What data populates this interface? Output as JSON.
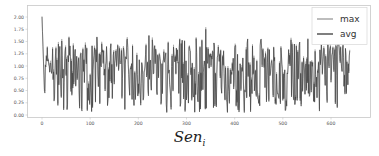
{
  "chart_data": {
    "type": "line",
    "title": "",
    "xlabel": "",
    "ylabel": "",
    "caption": "Sen",
    "caption_subscript": "i",
    "xlim": [
      -10,
      660
    ],
    "ylim": [
      -0.05,
      2.1
    ],
    "x_ticks": [
      0,
      100,
      200,
      300,
      400,
      500,
      600
    ],
    "x_tick_labels": [
      "0",
      "100",
      "200",
      "300",
      "400",
      "500",
      "600"
    ],
    "y_ticks": [
      0.0,
      0.25,
      0.5,
      0.75,
      1.0,
      1.25,
      1.5,
      1.75,
      2.0
    ],
    "y_tick_labels": [
      "0.00",
      "0.25",
      "0.50",
      "0.75",
      "1.00",
      "1.25",
      "1.50",
      "1.75",
      "2.00"
    ],
    "grid": false,
    "legend": {
      "position": "upper right",
      "entries": [
        "max",
        "avg"
      ]
    },
    "series": [
      {
        "name": "max",
        "color": "#9a9a9a",
        "n_points": 640,
        "range": [
          0.0,
          2.0
        ],
        "typical": [
          0.3,
          1.5
        ],
        "peak": {
          "x": 0,
          "y": 2.02
        }
      },
      {
        "name": "avg",
        "color": "#3a3a3a",
        "n_points": 640,
        "range": [
          0.0,
          2.0
        ],
        "typical": [
          0.3,
          1.5
        ],
        "peak": {
          "x": 0,
          "y": 2.0
        }
      }
    ],
    "note": "Dense noisy series of ~640 points each; max and avg nearly overlap, oscillating between ~0.05 and ~1.6 with spikes to ~1.75 near x=340 and ~2.0 at x=0."
  },
  "legend": {
    "items": [
      {
        "label": "max",
        "color": "#9a9a9a"
      },
      {
        "label": "avg",
        "color": "#3a3a3a"
      }
    ]
  },
  "caption": {
    "main": "Sen",
    "sub": "i"
  }
}
